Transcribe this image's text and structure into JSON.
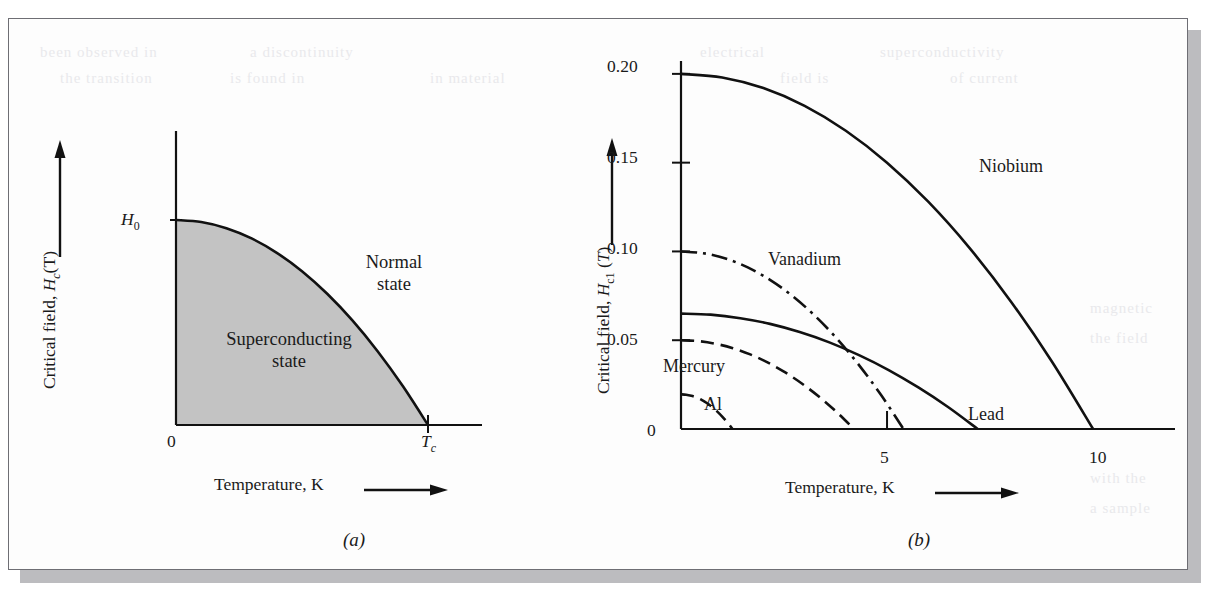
{
  "figure": {
    "panels": [
      {
        "caption": "(a)",
        "y_axis_title": "Critical field, Hc(T)",
        "y_axis_title_parts": {
          "prefix": "Critical field, ",
          "symbol": "H",
          "subscript": "c",
          "suffix": "(T)"
        },
        "x_axis_title": "Temperature, K",
        "x_axis_arrow": true,
        "y_axis_arrow": true,
        "tick_labels": {
          "x_origin": "0",
          "x_critical": "Tc",
          "y_max": "H0"
        },
        "region_labels": [
          {
            "name": "normal-state",
            "text": "Normal\nstate",
            "line1": "Normal",
            "line2": "state"
          },
          {
            "name": "superconducting-state",
            "text": "Superconducting\nstate",
            "line1": "Superconducting",
            "line2": "state"
          }
        ],
        "shade_color": "#c3c3c3"
      },
      {
        "caption": "(b)",
        "y_axis_title_parts": {
          "prefix": "Critical field, ",
          "symbol": "H",
          "subscript": "c1",
          "suffix": " (T)"
        },
        "x_axis_title": "Temperature, K",
        "x_axis_arrow": true,
        "y_axis_arrow": true
      }
    ]
  },
  "chart_data": [
    {
      "type": "line",
      "name": "panel-a-schematic",
      "title": "",
      "xlabel": "Temperature, K",
      "ylabel": "Critical field, Hc(T)",
      "xlim": [
        0,
        1.25
      ],
      "ylim": [
        0,
        1.15
      ],
      "grid": false,
      "legend": "none",
      "annotations": [
        "Normal state",
        "Superconducting state"
      ],
      "xtick_labels": [
        "0",
        "Tc"
      ],
      "xtick_values": [
        0,
        1
      ],
      "ytick_labels": [
        "H0"
      ],
      "ytick_values": [
        1
      ],
      "series": [
        {
          "name": "Hc(T) boundary",
          "style": "solid",
          "comment": "Hc = H0*(1-(T/Tc)^2)",
          "x": [
            0.0,
            0.1,
            0.2,
            0.3,
            0.4,
            0.5,
            0.6,
            0.7,
            0.8,
            0.9,
            1.0
          ],
          "y": [
            1.0,
            0.99,
            0.96,
            0.91,
            0.84,
            0.75,
            0.64,
            0.51,
            0.36,
            0.19,
            0.0
          ]
        }
      ]
    },
    {
      "type": "line",
      "name": "panel-b-materials",
      "title": "",
      "xlabel": "Temperature, K",
      "ylabel": "Critical field, Hc1 (T)",
      "xlim": [
        0,
        11.6
      ],
      "ylim": [
        0,
        0.205
      ],
      "grid": false,
      "legend": "inline-labels",
      "xtick_labels": [
        "5",
        "10"
      ],
      "xtick_values": [
        5,
        10
      ],
      "ytick_labels": [
        "0",
        "0.05",
        "0.10",
        "0.15",
        "0.20"
      ],
      "ytick_values": [
        0,
        0.05,
        0.1,
        0.15,
        0.2
      ],
      "series": [
        {
          "name": "Niobium",
          "style": "solid",
          "h0": 0.2,
          "tc": 10.0,
          "label_x": 7.0,
          "label_y": 0.162,
          "x": [
            0.0,
            1.0,
            2.0,
            3.0,
            4.0,
            5.0,
            6.0,
            7.0,
            8.0,
            9.0,
            10.0
          ],
          "y": [
            0.2,
            0.198,
            0.192,
            0.182,
            0.168,
            0.15,
            0.128,
            0.102,
            0.072,
            0.038,
            0.0
          ]
        },
        {
          "name": "Vanadium",
          "style": "dash-dot",
          "h0": 0.1,
          "tc": 5.4,
          "label_x": 2.3,
          "label_y": 0.094,
          "x": [
            0.0,
            0.54,
            1.08,
            1.62,
            2.16,
            2.7,
            3.24,
            3.78,
            4.32,
            4.86,
            5.4
          ],
          "y": [
            0.1,
            0.099,
            0.096,
            0.091,
            0.084,
            0.075,
            0.064,
            0.051,
            0.036,
            0.019,
            0.0
          ]
        },
        {
          "name": "Lead",
          "style": "solid",
          "h0": 0.065,
          "tc": 7.2,
          "label_x": 6.2,
          "label_y": 0.022,
          "x": [
            0.0,
            0.72,
            1.44,
            2.16,
            2.88,
            3.6,
            4.32,
            5.04,
            5.76,
            6.48,
            7.2
          ],
          "y": [
            0.065,
            0.0644,
            0.0624,
            0.0592,
            0.0546,
            0.0488,
            0.0416,
            0.0332,
            0.0234,
            0.0124,
            0.0
          ]
        },
        {
          "name": "Mercury",
          "style": "dashed",
          "h0": 0.05,
          "tc": 4.2,
          "label_x": 0.55,
          "label_y": 0.0215,
          "x": [
            0.0,
            0.42,
            0.84,
            1.26,
            1.68,
            2.1,
            2.52,
            2.94,
            3.36,
            3.78,
            4.2
          ],
          "y": [
            0.05,
            0.0495,
            0.048,
            0.0455,
            0.042,
            0.0375,
            0.032,
            0.0255,
            0.018,
            0.0095,
            0.0
          ]
        },
        {
          "name": "Al",
          "style": "dashed",
          "h0": 0.0195,
          "tc": 1.25,
          "label_x": 0.95,
          "label_y": 0.0095,
          "x": [
            0.0,
            0.125,
            0.25,
            0.375,
            0.5,
            0.625,
            0.75,
            0.875,
            1.0,
            1.125,
            1.25
          ],
          "y": [
            0.0195,
            0.01931,
            0.01872,
            0.01774,
            0.01638,
            0.01463,
            0.01248,
            0.00995,
            0.00702,
            0.00371,
            0.0
          ]
        }
      ]
    }
  ],
  "background_bleed": [
    {
      "text": "been observed in",
      "x": 40,
      "y": 44
    },
    {
      "text": "a discontinuity",
      "x": 250,
      "y": 44
    },
    {
      "text": "electrical",
      "x": 700,
      "y": 44
    },
    {
      "text": "superconductivity",
      "x": 880,
      "y": 44
    },
    {
      "text": "the transition",
      "x": 60,
      "y": 70
    },
    {
      "text": "is found in",
      "x": 230,
      "y": 70
    },
    {
      "text": "in material",
      "x": 430,
      "y": 70
    },
    {
      "text": "field is",
      "x": 780,
      "y": 70
    },
    {
      "text": "of current",
      "x": 950,
      "y": 70
    },
    {
      "text": "magnetic",
      "x": 1090,
      "y": 300
    },
    {
      "text": "the field",
      "x": 1090,
      "y": 330
    },
    {
      "text": "with the",
      "x": 1090,
      "y": 470
    },
    {
      "text": "a sample",
      "x": 1090,
      "y": 500
    }
  ]
}
